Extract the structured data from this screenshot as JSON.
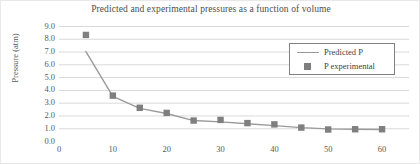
{
  "chart_data": {
    "type": "line",
    "title": "Predicted and experimental pressures as a function of volume",
    "xlabel": "",
    "ylabel": "Pressure (atm)",
    "xlim": [
      0,
      65
    ],
    "ylim": [
      0.0,
      9.0
    ],
    "xticks": [
      0,
      10,
      20,
      30,
      40,
      50,
      60
    ],
    "xtick_labels": [
      "0",
      "10",
      "20",
      "30",
      "40",
      "50",
      "60"
    ],
    "yticks": [
      0.0,
      1.0,
      2.0,
      3.0,
      4.0,
      5.0,
      6.0,
      7.0,
      8.0,
      9.0
    ],
    "ytick_labels": [
      "0.0",
      "1.0",
      "2.0",
      "3.0",
      "4.0",
      "5.0",
      "6.0",
      "7.0",
      "8.0",
      "9.0"
    ],
    "grid": true,
    "legend_position": "upper right",
    "x": [
      5,
      10,
      15,
      20,
      25,
      30,
      35,
      40,
      45,
      50,
      55,
      60
    ],
    "series": [
      {
        "name": "Predicted P",
        "type": "line",
        "color": "#9a9a9a",
        "values": [
          7.0,
          3.5,
          2.55,
          2.15,
          1.6,
          1.5,
          1.35,
          1.2,
          1.05,
          0.95,
          0.92,
          0.9
        ]
      },
      {
        "name": "P experimental",
        "type": "scatter",
        "marker": "square",
        "color": "#7f7f7f",
        "values": [
          8.3,
          3.55,
          2.6,
          2.2,
          1.6,
          1.65,
          1.4,
          1.3,
          1.05,
          0.9,
          0.92,
          0.92
        ]
      }
    ]
  },
  "legend": {
    "items": [
      {
        "label": "Predicted P",
        "swatch": "line-swatch"
      },
      {
        "label": "P experimental",
        "swatch": "square-marker-swatch"
      }
    ]
  },
  "colors": {
    "line": "#9a9a9a",
    "marker": "#7f7f7f",
    "grid": "#d9d9d9",
    "axis": "#bfbfbf",
    "text": "#595959",
    "legend_border": "#808080"
  }
}
